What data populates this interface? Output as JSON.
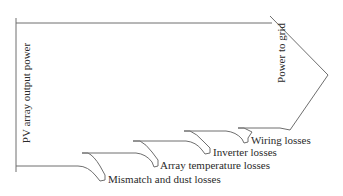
{
  "diagram": {
    "type": "sankey-style loss diagram",
    "input_label": "PV array output power",
    "output_label": "Power to grid",
    "losses": [
      {
        "label": "Mismatch and dust losses"
      },
      {
        "label": "Array temperature losses"
      },
      {
        "label": "Inverter losses"
      },
      {
        "label": "Wiring losses"
      }
    ],
    "colors": {
      "line": "#6e6e6e",
      "text": "#2a2a2a",
      "background": "#ffffff"
    }
  }
}
